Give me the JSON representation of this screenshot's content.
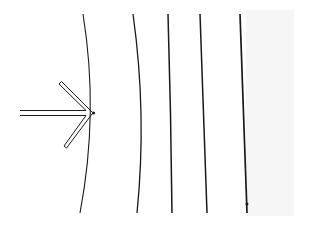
{
  "diagram": {
    "colors": {
      "background": "#ffffff",
      "stroke": "#1a1a1a",
      "shade": "#f6f6f6"
    },
    "arrow": {
      "direction": "right",
      "style": "double-line hollow arrow",
      "tip": [
        94,
        113
      ]
    },
    "wavefronts": [
      {
        "id": 1,
        "shape": "strongly curved",
        "top": [
          83,
          14
        ],
        "mid": [
          94,
          113
        ],
        "bottom": [
          80,
          213
        ]
      },
      {
        "id": 2,
        "shape": "slightly curved",
        "top": [
          133,
          14
        ],
        "mid": [
          141,
          114
        ],
        "bottom": [
          137,
          213
        ]
      },
      {
        "id": 3,
        "shape": "nearly straight",
        "top": [
          168,
          14
        ],
        "bottom": [
          172,
          213
        ]
      },
      {
        "id": 4,
        "shape": "straight",
        "top": [
          200,
          14
        ],
        "bottom": [
          207,
          213
        ]
      },
      {
        "id": 5,
        "shape": "straight",
        "top": [
          240,
          14
        ],
        "bottom": [
          247,
          213
        ]
      }
    ]
  }
}
